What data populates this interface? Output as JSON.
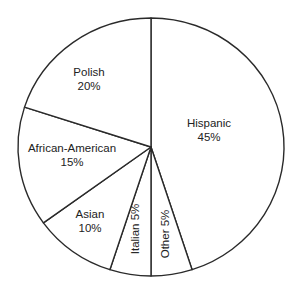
{
  "chart_data": {
    "type": "pie",
    "title": "",
    "start_angle": "12 o'clock",
    "direction": "clockwise",
    "slices": [
      {
        "label": "Hispanic",
        "value": 45,
        "display": "45%"
      },
      {
        "label": "Other",
        "value": 5,
        "display": "5%"
      },
      {
        "label": "Italian",
        "value": 5,
        "display": "5%"
      },
      {
        "label": "Asian",
        "value": 10,
        "display": "10%"
      },
      {
        "label": "African-American",
        "value": 15,
        "display": "15%"
      },
      {
        "label": "Polish",
        "value": 20,
        "display": "20%"
      }
    ],
    "categories": [
      "Hispanic",
      "Other",
      "Italian",
      "Asian",
      "African-American",
      "Polish"
    ],
    "values": [
      45,
      5,
      5,
      10,
      15,
      20
    ],
    "legend": "none (labels inside slices)",
    "colors": {
      "fill": "#ffffff",
      "stroke": "#2a2a2a",
      "text": "#222222"
    }
  },
  "labels": {
    "hispanic_name": "Hispanic",
    "hispanic_pct": "45%",
    "polish_name": "Polish",
    "polish_pct": "20%",
    "african_american_name": "African-American",
    "african_american_pct": "15%",
    "asian_name": "Asian",
    "asian_pct": "10%",
    "italian": "Italian 5%",
    "other": "Other 5%"
  }
}
